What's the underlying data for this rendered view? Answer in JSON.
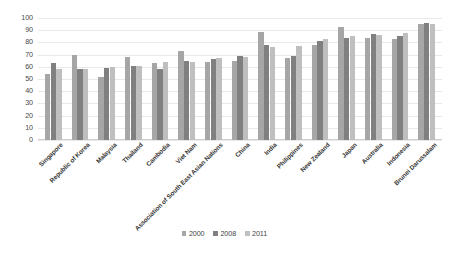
{
  "chart_data": {
    "type": "bar",
    "title": "",
    "subtitle": "",
    "xlabel": "",
    "ylabel": "",
    "ylim": [
      0,
      100
    ],
    "yticks": [
      0,
      10,
      20,
      30,
      40,
      50,
      60,
      70,
      80,
      90,
      100
    ],
    "grid": true,
    "legend_position": "bottom",
    "categories": [
      "Singapore",
      "Republic of Korea",
      "Malaysia",
      "Thailand",
      "Cambodia",
      "Viet Nam",
      "Association of South East Asian Nations",
      "China",
      "India",
      "Philippines",
      "New Zealand",
      "Japan",
      "Australia",
      "Indonesia",
      "Brunei Darussalam"
    ],
    "series": [
      {
        "name": "2000",
        "color": "#a6a6a6",
        "values": [
          54,
          70,
          52,
          68,
          63,
          73,
          64,
          64.5,
          88.5,
          67,
          78,
          92.5,
          84,
          83,
          95
        ]
      },
      {
        "name": "2008",
        "color": "#808080",
        "values": [
          63,
          58.5,
          59,
          61,
          58,
          65,
          66.5,
          68.5,
          78,
          68.5,
          81.5,
          84,
          86.5,
          85.5,
          96
        ]
      },
      {
        "name": "2011",
        "color": "#bfbfbf",
        "values": [
          58,
          58.5,
          59.5,
          61,
          64,
          64,
          67,
          68,
          76,
          77,
          83,
          85,
          86,
          88,
          95.5
        ]
      }
    ]
  },
  "legend": {
    "items": [
      {
        "label": "2000",
        "color": "#a6a6a6"
      },
      {
        "label": "2008",
        "color": "#808080"
      },
      {
        "label": "2011",
        "color": "#bfbfbf"
      }
    ]
  },
  "axis": {
    "y_tick_labels": [
      "100",
      "90",
      "80",
      "70",
      "60",
      "50",
      "40",
      "30",
      "20",
      "10",
      "0"
    ]
  }
}
